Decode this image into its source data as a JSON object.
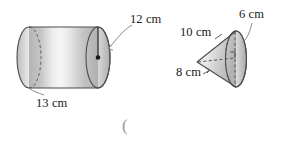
{
  "figures": [
    {
      "name": "cylinder",
      "shape": "cylinder",
      "labels": {
        "radius": "12 cm",
        "length": "13 cm"
      }
    },
    {
      "name": "cone",
      "shape": "cone",
      "labels": {
        "radius": "6 cm",
        "slant_upper": "10 cm",
        "slant_lower": "8 cm"
      }
    }
  ],
  "annotations": {
    "open_paren": "("
  },
  "colors": {
    "outline": "#4d4d4d",
    "fill_dark": "#b0b0b0",
    "fill_mid": "#c6c6c6",
    "fill_light": "#f2f2f2",
    "dashed": "#6e6e6e",
    "text": "#1a1a1a",
    "faint_text": "#9a9a9a",
    "background": "#ffffff"
  }
}
